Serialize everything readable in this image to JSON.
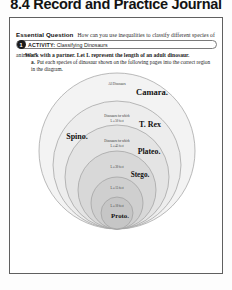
{
  "page": {
    "journal_title": "8.4 Record and Practice Journal"
  },
  "essential_question": {
    "label": "Essential Question",
    "text": "How can you use inequalities to classify different species of animals?"
  },
  "activity": {
    "number": "1",
    "label": "ACTIVITY:",
    "title": "Classifying Dinosaurs"
  },
  "instructions": {
    "work_line": "Work with a partner. Let L represent the length of an adult dinosaur.",
    "part_a_label": "a.",
    "part_a_text": "Put each species of dinosaur shown on the following pages into the correct region in the diagram."
  },
  "diagram": {
    "rings": [
      {
        "note_line1": "All Dinosaurs",
        "note_line2": "",
        "species": "Camara."
      },
      {
        "note_line1": "Dinosaurs for which",
        "note_line2": "L ≤ 50 feet",
        "species": "T. Rex"
      },
      {
        "note_line1": "Dinosaurs for which",
        "note_line2": "L ≤ 45 feet",
        "species": "Plateo."
      },
      {
        "note_line1": "",
        "note_line2": "L ≤ 30 feet",
        "species": "Stego."
      },
      {
        "note_line1": "",
        "note_line2": "L ≤ 15 feet",
        "species": ""
      },
      {
        "note_line1": "",
        "note_line2": "L ≤ 10 feet",
        "species": "Proto."
      }
    ],
    "outer_species": "Spino."
  },
  "colors": {
    "border": "#5f5f5f",
    "ring_stroke": "#9a9a9a",
    "ring_fill_outer": "#f2f2f2",
    "ring_fill_inner": "#c9c9c9",
    "accent_dark": "#1b1b1b"
  }
}
